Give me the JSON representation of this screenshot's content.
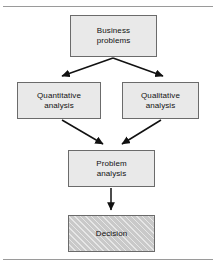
{
  "figure": {
    "type": "flowchart",
    "title": "",
    "orientation": "top-to-bottom",
    "background_color": "#ffffff",
    "frame": {
      "top_rule": true,
      "bottom_rule": true,
      "rule_color": "#9a9a9a"
    },
    "node_style": {
      "fill_color": "#e9e9e9",
      "border_color": "#6b6b6b",
      "text_color": "#111111",
      "highlight_fill_color": "#c9c9c9",
      "highlight_pattern": "diagonal-hatch"
    },
    "nodes": [
      {
        "id": "business-problems",
        "label": "Business\nproblems",
        "shape": "rectangle",
        "fill": "plain"
      },
      {
        "id": "quantitative-analysis",
        "label": "Quantitative\nanalysis",
        "shape": "rectangle",
        "fill": "plain"
      },
      {
        "id": "qualitative-analysis",
        "label": "Qualitative\nanalysis",
        "shape": "rectangle",
        "fill": "plain"
      },
      {
        "id": "problem-analysis",
        "label": "Problem\nanalysis",
        "shape": "rectangle",
        "fill": "plain"
      },
      {
        "id": "decision",
        "label": "Decision",
        "shape": "rectangle",
        "fill": "hatched"
      }
    ],
    "edges": [
      {
        "from": "business-problems",
        "to": "quantitative-analysis",
        "style": "arrow"
      },
      {
        "from": "business-problems",
        "to": "qualitative-analysis",
        "style": "arrow"
      },
      {
        "from": "quantitative-analysis",
        "to": "problem-analysis",
        "style": "arrow"
      },
      {
        "from": "qualitative-analysis",
        "to": "problem-analysis",
        "style": "arrow"
      },
      {
        "from": "problem-analysis",
        "to": "decision",
        "style": "arrow"
      }
    ]
  }
}
